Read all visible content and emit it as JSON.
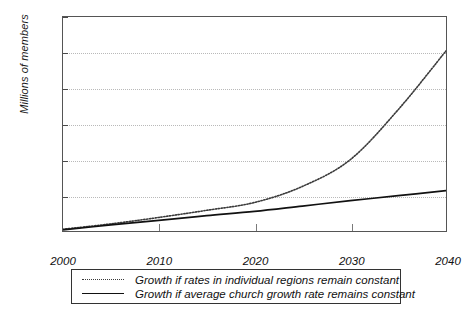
{
  "chart_data": {
    "type": "line",
    "title": "",
    "xlabel": "",
    "ylabel": "Millions of members",
    "xlim": [
      2000,
      2040
    ],
    "ylim": [
      0,
      600
    ],
    "grid": true,
    "grid_axis": "y",
    "legend_position": "below-plot",
    "x": [
      2000,
      2005,
      2010,
      2015,
      2020,
      2025,
      2030,
      2035,
      2040
    ],
    "xticks": [
      "2000",
      "2010",
      "2020",
      "2030",
      "2040"
    ],
    "yticks": [
      "0",
      "100",
      "200",
      "300",
      "400",
      "500",
      "600"
    ],
    "series": [
      {
        "name": "Growth if rates in individual regions remain constant",
        "style": "dotted",
        "color": "#3a3a3a",
        "values": [
          5,
          20,
          38,
          58,
          80,
          125,
          200,
          340,
          505
        ]
      },
      {
        "name": "Growth if average church growth rate remains constant",
        "style": "solid",
        "color": "#111111",
        "values": [
          3,
          17,
          30,
          43,
          55,
          70,
          85,
          99,
          113
        ]
      }
    ]
  },
  "axis": {
    "y_title": "Millions of members"
  },
  "legend": {
    "items": [
      {
        "sample": "dotted-line-sample",
        "label": "Growth if rates in individual regions remain constant"
      },
      {
        "sample": "solid-line-sample",
        "label": "Growth if average church growth rate remains constant"
      }
    ]
  }
}
